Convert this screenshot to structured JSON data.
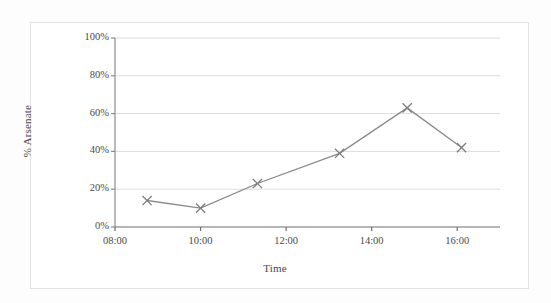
{
  "chart_data": {
    "type": "line",
    "title": "",
    "xlabel": "Time",
    "ylabel": "% Arsenate",
    "x_tick_labels": [
      "08:00",
      "10:00",
      "12:00",
      "14:00",
      "16:00"
    ],
    "x_tick_values": [
      8.0,
      10.0,
      12.0,
      14.0,
      16.0
    ],
    "y_tick_labels": [
      "0%",
      "20%",
      "40%",
      "60%",
      "80%",
      "100%"
    ],
    "y_tick_values": [
      0,
      20,
      40,
      60,
      80,
      100
    ],
    "xlim": [
      8.0,
      17.0
    ],
    "ylim": [
      0,
      100
    ],
    "grid": "horizontal",
    "legend": "none",
    "marker": "x",
    "series": [
      {
        "name": "% Arsenate",
        "color": "#8a8a8a",
        "points": [
          {
            "time": "08:45",
            "x": 8.75,
            "y": 14
          },
          {
            "time": "10:00",
            "x": 10.0,
            "y": 10
          },
          {
            "time": "11:20",
            "x": 11.33,
            "y": 23
          },
          {
            "time": "13:15",
            "x": 13.25,
            "y": 39
          },
          {
            "time": "14:50",
            "x": 14.83,
            "y": 63
          },
          {
            "time": "16:05",
            "x": 16.1,
            "y": 42
          }
        ]
      }
    ]
  },
  "style": {
    "line_color": "#8a8a8a",
    "marker_color": "#7d7d7d",
    "grid_color": "#dcdcdc",
    "axis_color": "#8c8c8c",
    "text_color": "#4a4a4a",
    "frame_color": "#e2e2e2",
    "background": "#ffffff"
  }
}
